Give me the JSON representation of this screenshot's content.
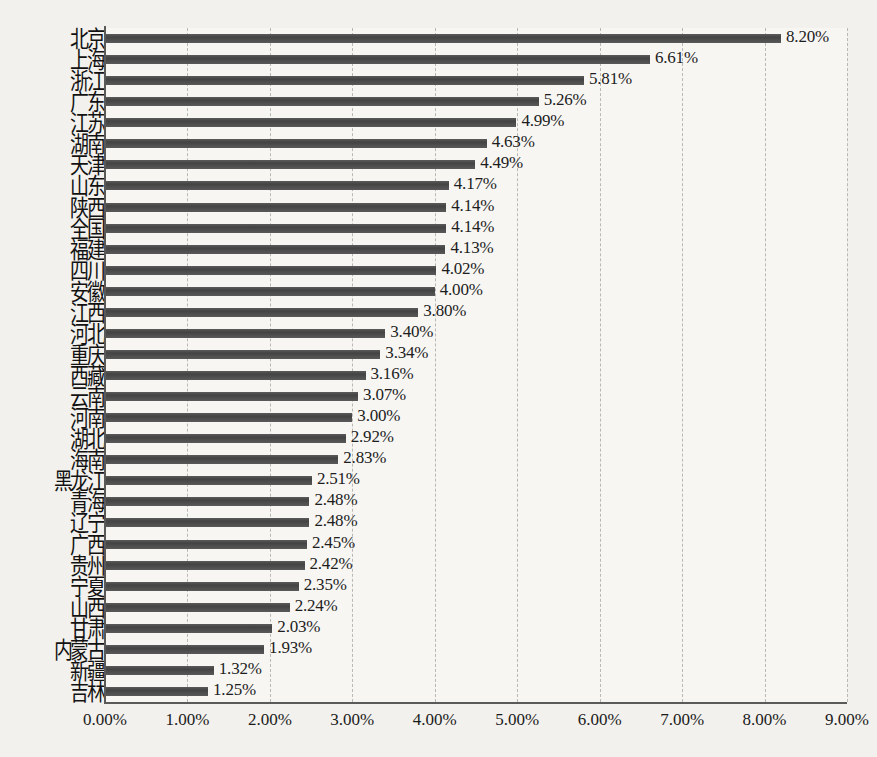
{
  "chart_data": {
    "type": "bar",
    "orientation": "horizontal",
    "title": "",
    "subtitle": "",
    "xlabel": "",
    "ylabel": "",
    "xlim": [
      0,
      9
    ],
    "xtick_labels": [
      "0.00%",
      "1.00%",
      "2.00%",
      "3.00%",
      "4.00%",
      "5.00%",
      "6.00%",
      "7.00%",
      "8.00%",
      "9.00%"
    ],
    "xtick_values": [
      0,
      1,
      2,
      3,
      4,
      5,
      6,
      7,
      8,
      9
    ],
    "grid": "vertical-dashed",
    "legend": "none",
    "value_label_format": "0.00%",
    "bar_color": "#4d4d4d",
    "background_color": "#f2f1ed",
    "plot_background_color": "#f7f6f3",
    "axis_color": "#5a5a58",
    "gridline_color": "#b9b8b4",
    "categories": [
      "北京",
      "上海",
      "浙江",
      "广东",
      "江苏",
      "湖南",
      "天津",
      "山东",
      "陕西",
      "全国",
      "福建",
      "四川",
      "安徽",
      "江西",
      "河北",
      "重庆",
      "西藏",
      "云南",
      "河南",
      "湖北",
      "海南",
      "黑龙江",
      "青海",
      "辽宁",
      "广西",
      "贵州",
      "宁夏",
      "山西",
      "甘肃",
      "内蒙古",
      "新疆",
      "吉林"
    ],
    "values": [
      8.2,
      6.61,
      5.81,
      5.26,
      4.99,
      4.63,
      4.49,
      4.17,
      4.14,
      4.14,
      4.13,
      4.02,
      4.0,
      3.8,
      3.4,
      3.34,
      3.16,
      3.07,
      3.0,
      2.92,
      2.83,
      2.51,
      2.48,
      2.48,
      2.45,
      2.42,
      2.35,
      2.24,
      2.03,
      1.93,
      1.32,
      1.25
    ],
    "value_labels": [
      "8.20%",
      "6.61%",
      "5.81%",
      "5.26%",
      "4.99%",
      "4.63%",
      "4.49%",
      "4.17%",
      "4.14%",
      "4.14%",
      "4.13%",
      "4.02%",
      "4.00%",
      "3.80%",
      "3.40%",
      "3.34%",
      "3.16%",
      "3.07%",
      "3.00%",
      "2.92%",
      "2.83%",
      "2.51%",
      "2.48%",
      "2.48%",
      "2.45%",
      "2.42%",
      "2.35%",
      "2.24%",
      "2.03%",
      "1.93%",
      "1.32%",
      "1.25%"
    ]
  }
}
